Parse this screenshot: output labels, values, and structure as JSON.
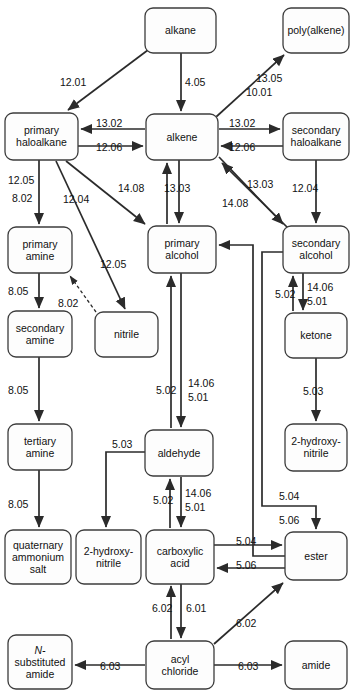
{
  "diagram": {
    "colors": {
      "box_fill": "#fdfdfd",
      "box_stroke": "#3c3c3c",
      "arrow": "#2b2b2b",
      "text": "#111111",
      "background": "#ffffff"
    }
  },
  "nodes": [
    {
      "id": "alkane",
      "label": "alkane",
      "lines": [
        "alkane"
      ],
      "x": 145,
      "y": 8,
      "w": 71,
      "h": 45
    },
    {
      "id": "polyalkene",
      "label": "poly(alkene)",
      "lines": [
        "poly(alkene)"
      ],
      "x": 283,
      "y": 8,
      "w": 66,
      "h": 45
    },
    {
      "id": "primary-haloalkane",
      "label": "primary haloalkane",
      "lines": [
        "primary",
        "haloalkane"
      ],
      "x": 5,
      "y": 113,
      "w": 73,
      "h": 47
    },
    {
      "id": "alkene",
      "label": "alkene",
      "lines": [
        "alkene"
      ],
      "x": 146,
      "y": 114,
      "w": 72,
      "h": 46
    },
    {
      "id": "secondary-haloalkane",
      "label": "secondary haloalkane",
      "lines": [
        "secondary",
        "haloalkane"
      ],
      "x": 283,
      "y": 113,
      "w": 66,
      "h": 47
    },
    {
      "id": "primary-amine",
      "label": "primary amine",
      "lines": [
        "primary",
        "amine"
      ],
      "x": 8,
      "y": 227,
      "w": 64,
      "h": 46
    },
    {
      "id": "primary-alcohol",
      "label": "primary alcohol",
      "lines": [
        "primary",
        "alcohol"
      ],
      "x": 148,
      "y": 226,
      "w": 68,
      "h": 47
    },
    {
      "id": "secondary-alcohol",
      "label": "secondary alcohol",
      "lines": [
        "secondary",
        "alcohol"
      ],
      "x": 283,
      "y": 226,
      "w": 66,
      "h": 47
    },
    {
      "id": "secondary-amine",
      "label": "secondary amine",
      "lines": [
        "secondary",
        "amine"
      ],
      "x": 8,
      "y": 311,
      "w": 64,
      "h": 46
    },
    {
      "id": "nitrile",
      "label": "nitrile",
      "lines": [
        "nitrile"
      ],
      "x": 95,
      "y": 312,
      "w": 63,
      "h": 45
    },
    {
      "id": "ketone",
      "label": "ketone",
      "lines": [
        "ketone"
      ],
      "x": 285,
      "y": 313,
      "w": 62,
      "h": 45
    },
    {
      "id": "tertiary-amine",
      "label": "tertiary amine",
      "lines": [
        "tertiary",
        "amine"
      ],
      "x": 8,
      "y": 424,
      "w": 64,
      "h": 46
    },
    {
      "id": "aldehyde",
      "label": "aldehyde",
      "lines": [
        "aldehyde"
      ],
      "x": 145,
      "y": 430,
      "w": 68,
      "h": 46
    },
    {
      "id": "2-hydroxynitrile-top",
      "label": "2-hydroxy-nitrile",
      "lines": [
        "2-hydroxy-",
        "nitrile"
      ],
      "x": 285,
      "y": 424,
      "w": 62,
      "h": 47
    },
    {
      "id": "quaternary-salt",
      "label": "quaternary ammonium salt",
      "lines": [
        "quaternary",
        "ammonium",
        "salt"
      ],
      "x": 5,
      "y": 530,
      "w": 66,
      "h": 54
    },
    {
      "id": "2-hydroxynitrile-bot",
      "label": "2-hydroxy-nitrile",
      "lines": [
        "2-hydroxy-",
        "nitrile"
      ],
      "x": 76,
      "y": 530,
      "w": 65,
      "h": 54
    },
    {
      "id": "carboxylic-acid",
      "label": "carboxylic acid",
      "lines": [
        "carboxylic",
        "acid"
      ],
      "x": 146,
      "y": 530,
      "w": 68,
      "h": 54
    },
    {
      "id": "ester",
      "label": "ester",
      "lines": [
        "ester"
      ],
      "x": 285,
      "y": 532,
      "w": 62,
      "h": 48
    },
    {
      "id": "n-substituted-amide",
      "label": "N-substituted amide",
      "lines": [
        "N-",
        "substituted",
        "amide"
      ],
      "x": 8,
      "y": 635,
      "w": 64,
      "h": 54
    },
    {
      "id": "acyl-chloride",
      "label": "acyl chloride",
      "lines": [
        "acyl",
        "chloride"
      ],
      "x": 146,
      "y": 641,
      "w": 68,
      "h": 48
    },
    {
      "id": "amide",
      "label": "amide",
      "lines": [
        "amide"
      ],
      "x": 285,
      "y": 641,
      "w": 62,
      "h": 48
    }
  ],
  "edges": [
    {
      "from": "alkane",
      "to": "primary-haloalkane",
      "label": "12.01",
      "lx": 60,
      "ly": 86
    },
    {
      "from": "alkane",
      "to": "alkene",
      "label": "4.05",
      "lx": 185,
      "ly": 86
    },
    {
      "from": "alkene",
      "to": "polyalkene",
      "label": "13.05",
      "lx": 256,
      "ly": 82
    },
    {
      "from": "alkene",
      "to": "polyalkene",
      "label": "10.01",
      "lx": 246,
      "ly": 96
    },
    {
      "from": "alkene",
      "to": "primary-haloalkane",
      "label": "13.02",
      "lx": 96,
      "ly": 127
    },
    {
      "from": "primary-haloalkane",
      "to": "alkene",
      "label": "12.06",
      "lx": 96,
      "ly": 151
    },
    {
      "from": "alkene",
      "to": "secondary-haloalkane",
      "label": "13.02",
      "lx": 229,
      "ly": 127
    },
    {
      "from": "secondary-haloalkane",
      "to": "alkene",
      "label": "12.06",
      "lx": 229,
      "ly": 151
    },
    {
      "from": "primary-haloalkane",
      "to": "primary-amine",
      "label": "12.05",
      "lx": 8,
      "ly": 184
    },
    {
      "from": "primary-haloalkane",
      "to": "primary-amine",
      "label": "8.02",
      "lx": 12,
      "ly": 202
    },
    {
      "from": "primary-haloalkane",
      "to": "primary-alcohol",
      "label": "12.04",
      "lx": 63,
      "ly": 203
    },
    {
      "from": "primary-haloalkane",
      "to": "nitrile",
      "label": "12.05",
      "lx": 100,
      "ly": 268
    },
    {
      "from": "primary-alcohol",
      "to": "alkene",
      "label": "14.08",
      "lx": 118,
      "ly": 192
    },
    {
      "from": "alkene",
      "to": "primary-alcohol",
      "label": "13.03",
      "lx": 164,
      "ly": 192
    },
    {
      "from": "alkene",
      "to": "secondary-alcohol",
      "label": "13.03",
      "lx": 247,
      "ly": 188
    },
    {
      "from": "secondary-alcohol",
      "to": "alkene",
      "label": "14.08",
      "lx": 222,
      "ly": 207
    },
    {
      "from": "secondary-haloalkane",
      "to": "secondary-alcohol",
      "label": "12.04",
      "lx": 292,
      "ly": 192
    },
    {
      "from": "primary-amine",
      "to": "secondary-amine",
      "label": "8.05",
      "lx": 8,
      "ly": 295
    },
    {
      "from": "nitrile",
      "to": "primary-amine",
      "label": "8.02",
      "lx": 58,
      "ly": 307
    },
    {
      "from": "secondary-amine",
      "to": "tertiary-amine",
      "label": "8.05",
      "lx": 8,
      "ly": 394
    },
    {
      "from": "tertiary-amine",
      "to": "quaternary-salt",
      "label": "8.05",
      "lx": 8,
      "ly": 508
    },
    {
      "from": "secondary-alcohol",
      "to": "ketone",
      "label": "14.06",
      "lx": 307,
      "ly": 291
    },
    {
      "from": "secondary-alcohol",
      "to": "ketone",
      "label": "5.01",
      "lx": 307,
      "ly": 305
    },
    {
      "from": "ketone",
      "to": "secondary-alcohol",
      "label": "5.02",
      "lx": 275,
      "ly": 298
    },
    {
      "from": "ketone",
      "to": "2-hydroxynitrile-top",
      "label": "5.03",
      "lx": 303,
      "ly": 395
    },
    {
      "from": "primary-alcohol",
      "to": "aldehyde",
      "label": "14.06",
      "lx": 188,
      "ly": 387
    },
    {
      "from": "primary-alcohol",
      "to": "aldehyde",
      "label": "5.01",
      "lx": 188,
      "ly": 401
    },
    {
      "from": "aldehyde",
      "to": "primary-alcohol",
      "label": "5.02",
      "lx": 156,
      "ly": 394
    },
    {
      "from": "aldehyde",
      "to": "2-hydroxynitrile-bot",
      "label": "5.03",
      "lx": 112,
      "ly": 448
    },
    {
      "from": "aldehyde",
      "to": "carboxylic-acid",
      "label": "14.06",
      "lx": 185,
      "ly": 497
    },
    {
      "from": "aldehyde",
      "to": "carboxylic-acid",
      "label": "5.01",
      "lx": 185,
      "ly": 511
    },
    {
      "from": "carboxylic-acid",
      "to": "aldehyde",
      "label": "5.02",
      "lx": 153,
      "ly": 504
    },
    {
      "from": "secondary-alcohol",
      "to": "ester",
      "label": "5.04",
      "lx": 279,
      "ly": 500
    },
    {
      "from": "ester",
      "to": "primary-alcohol",
      "label": "5.06",
      "lx": 279,
      "ly": 524
    },
    {
      "from": "carboxylic-acid",
      "to": "ester",
      "label": "5.04",
      "lx": 236,
      "ly": 545
    },
    {
      "from": "ester",
      "to": "carboxylic-acid",
      "label": "5.06",
      "lx": 236,
      "ly": 569
    },
    {
      "from": "carboxylic-acid",
      "to": "acyl-chloride",
      "label": "6.01",
      "lx": 186,
      "ly": 612
    },
    {
      "from": "acyl-chloride",
      "to": "carboxylic-acid",
      "label": "6.02",
      "lx": 152,
      "ly": 612
    },
    {
      "from": "acyl-chloride",
      "to": "ester",
      "label": "6.02",
      "lx": 236,
      "ly": 627
    },
    {
      "from": "acyl-chloride",
      "to": "n-substituted-amide",
      "label": "6.03",
      "lx": 100,
      "ly": 670
    },
    {
      "from": "acyl-chloride",
      "to": "amide",
      "label": "6.03",
      "lx": 238,
      "ly": 670
    }
  ]
}
